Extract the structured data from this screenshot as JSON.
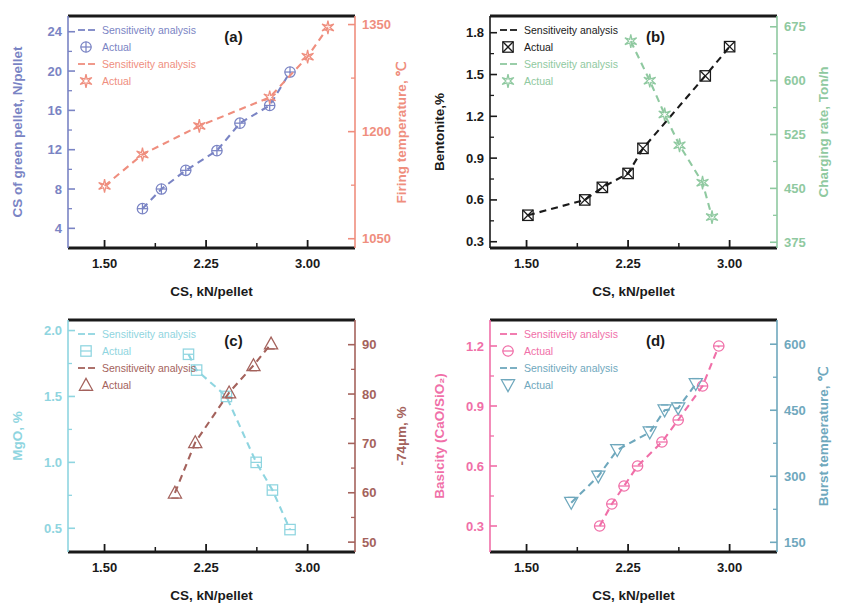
{
  "figure": {
    "width": 845,
    "height": 609,
    "background": "#ffffff"
  },
  "colors": {
    "axis_black": "#1a1a1a",
    "a_left": "#7a84c4",
    "a_right": "#ef8e7e",
    "b_left": "#1a1a1a",
    "b_right": "#8fc9a0",
    "c_left": "#8fd5e0",
    "c_right": "#a4625c",
    "d_left": "#f06fa8",
    "d_right": "#6fa8bd"
  },
  "common": {
    "xlabel": "CS, kN/pellet",
    "xticks": [
      "1.50",
      "2.25",
      "3.00"
    ],
    "xtick_values": [
      1.5,
      2.25,
      3.0
    ],
    "xlim": [
      1.23,
      3.35
    ],
    "legend_sensitivity": "Sensitiveity analysis",
    "legend_actual": "Actual"
  },
  "chart_data": [
    {
      "id": "a",
      "tag": "(a)",
      "type": "scatter",
      "title": "",
      "xlabel": "CS, kN/pellet",
      "xlim": [
        1.23,
        3.35
      ],
      "xticks": [
        1.5,
        2.25,
        3.0
      ],
      "xticklabels": [
        "1.50",
        "2.25",
        "3.00"
      ],
      "grid": false,
      "legend_position": "upper-left",
      "axes": [
        {
          "side": "left",
          "label": "CS of green pellet, N/pellet",
          "color": "#7a84c4",
          "ylim": [
            2.0,
            25.6
          ],
          "yticks": [
            4,
            8,
            12,
            16,
            20,
            24
          ],
          "yticklabels": [
            "4",
            "8",
            "12",
            "16",
            "20",
            "24"
          ]
        },
        {
          "side": "right",
          "label": "Firing temperature, ℃",
          "color": "#ef8e7e",
          "ylim": [
            1037,
            1362
          ],
          "yticks": [
            1050,
            1200,
            1350
          ],
          "yticklabels": [
            "1050",
            "1200",
            "1350"
          ]
        }
      ],
      "series": [
        {
          "name": "CS of green pellet, N/pellet",
          "legend_sensitivity": "Sensitiveity analysis",
          "legend_actual": "Actual",
          "axis": "left",
          "color": "#7a84c4",
          "marker": "circle-plus",
          "linestyle": "dashed",
          "x": [
            1.78,
            1.92,
            2.1,
            2.33,
            2.5,
            2.72,
            2.87
          ],
          "y": [
            6.0,
            8.0,
            9.9,
            11.9,
            14.7,
            16.5,
            19.9
          ]
        },
        {
          "name": "Firing temperature, ℃",
          "legend_sensitivity": "Sensitiveity analysis",
          "legend_actual": "Actual",
          "axis": "right",
          "color": "#ef8e7e",
          "marker": "star",
          "linestyle": "dashed",
          "x": [
            1.5,
            1.78,
            2.2,
            2.72,
            3.0,
            3.15
          ],
          "y": [
            1124,
            1168,
            1208,
            1248,
            1305,
            1346
          ]
        }
      ]
    },
    {
      "id": "b",
      "tag": "(b)",
      "type": "scatter",
      "title": "",
      "xlabel": "CS, kN/pellet",
      "xlim": [
        1.23,
        3.35
      ],
      "xticks": [
        1.5,
        2.25,
        3.0
      ],
      "xticklabels": [
        "1.50",
        "2.25",
        "3.00"
      ],
      "grid": false,
      "legend_position": "upper-left",
      "axes": [
        {
          "side": "left",
          "label": "Bentonite,%",
          "color": "#1a1a1a",
          "ylim": [
            0.255,
            1.92
          ],
          "yticks": [
            0.3,
            0.6,
            0.9,
            1.2,
            1.5,
            1.8
          ],
          "yticklabels": [
            "0.3",
            "0.6",
            "0.9",
            "1.2",
            "1.5",
            "1.8"
          ]
        },
        {
          "side": "right",
          "label": "Charging rate, Ton/h",
          "color": "#8fc9a0",
          "ylim": [
            367,
            690
          ],
          "yticks": [
            375,
            450,
            525,
            600,
            675
          ],
          "yticklabels": [
            "375",
            "450",
            "525",
            "600",
            "675"
          ]
        }
      ],
      "series": [
        {
          "name": "Bentonite,%",
          "legend_sensitivity": "Sensitiveity analysis",
          "legend_actual": "Actual",
          "axis": "left",
          "color": "#1a1a1a",
          "marker": "square-x",
          "linestyle": "dashed",
          "x": [
            1.51,
            1.93,
            2.06,
            2.25,
            2.36,
            2.82,
            3.0
          ],
          "y": [
            0.49,
            0.6,
            0.69,
            0.79,
            0.97,
            1.49,
            1.7
          ]
        },
        {
          "name": "Charging rate, Ton/h",
          "legend_sensitivity": "Sensitiveity analysis",
          "legend_actual": "Actual",
          "axis": "right",
          "color": "#8fc9a0",
          "marker": "star",
          "linestyle": "dashed",
          "x": [
            2.27,
            2.41,
            2.52,
            2.63,
            2.8,
            2.87
          ],
          "y": [
            655,
            600,
            553,
            510,
            458,
            410
          ]
        }
      ]
    },
    {
      "id": "c",
      "tag": "(c)",
      "type": "scatter",
      "title": "",
      "xlabel": "CS, kN/pellet",
      "xlim": [
        1.23,
        3.35
      ],
      "xticks": [
        1.5,
        2.25,
        3.0
      ],
      "xticklabels": [
        "1.50",
        "2.25",
        "3.00"
      ],
      "grid": false,
      "legend_position": "upper-left",
      "axes": [
        {
          "side": "left",
          "label": "MgO, %",
          "color": "#8fd5e0",
          "ylim": [
            0.32,
            2.08
          ],
          "yticks": [
            0.5,
            1.0,
            1.5,
            2.0
          ],
          "yticklabels": [
            "0.5",
            "1.0",
            "1.5",
            "2.0"
          ]
        },
        {
          "side": "right",
          "label": "-74µm, %",
          "color": "#a4625c",
          "ylim": [
            48,
            95
          ],
          "yticks": [
            50,
            60,
            70,
            80,
            90
          ],
          "yticklabels": [
            "50",
            "60",
            "70",
            "80",
            "90"
          ]
        }
      ],
      "series": [
        {
          "name": "MgO, %",
          "legend_sensitivity": "Sensitiveity analysis",
          "legend_actual": "Actual",
          "axis": "left",
          "color": "#8fd5e0",
          "marker": "square-h",
          "linestyle": "dashed",
          "x": [
            2.12,
            2.18,
            2.4,
            2.62,
            2.74,
            2.87
          ],
          "y": [
            1.82,
            1.7,
            1.5,
            1.0,
            0.79,
            0.49
          ]
        },
        {
          "name": "-74µm, %",
          "legend_sensitivity": "Sensitiveity analysis",
          "legend_actual": "Actual",
          "axis": "right",
          "color": "#a4625c",
          "marker": "triangle-up",
          "linestyle": "dashed",
          "x": [
            2.02,
            2.17,
            2.42,
            2.6,
            2.73
          ],
          "y": [
            60.0,
            70.2,
            80.3,
            85.8,
            90.2
          ]
        }
      ]
    },
    {
      "id": "d",
      "tag": "(d)",
      "type": "scatter",
      "title": "",
      "xlabel": "CS, kN/pellet",
      "xlim": [
        1.23,
        3.35
      ],
      "xticks": [
        1.5,
        2.25,
        3.0
      ],
      "xticklabels": [
        "1.50",
        "2.25",
        "3.00"
      ],
      "grid": false,
      "legend_position": "upper-left",
      "axes": [
        {
          "side": "left",
          "label": "Basicity (CaO/SiO₂)",
          "color": "#f06fa8",
          "ylim": [
            0.17,
            1.33
          ],
          "yticks": [
            0.3,
            0.6,
            0.9,
            1.2
          ],
          "yticklabels": [
            "0.3",
            "0.6",
            "0.9",
            "1.2"
          ]
        },
        {
          "side": "right",
          "label": "Burst temperature, ℃",
          "color": "#6fa8bd",
          "ylim": [
            128,
            655
          ],
          "yticks": [
            150,
            300,
            450,
            600
          ],
          "yticklabels": [
            "150",
            "300",
            "450",
            "600"
          ]
        }
      ],
      "series": [
        {
          "name": "Basicity (CaO/SiO2)",
          "legend_sensitivity": "Sensitiveity analysis",
          "legend_actual": "Actual",
          "axis": "left",
          "color": "#f06fa8",
          "marker": "circle-minus",
          "linestyle": "dashed",
          "x": [
            2.04,
            2.13,
            2.22,
            2.32,
            2.5,
            2.62,
            2.8,
            2.92
          ],
          "y": [
            0.3,
            0.41,
            0.5,
            0.6,
            0.72,
            0.83,
            1.0,
            1.2
          ]
        },
        {
          "name": "Burst temperature, ℃",
          "legend_sensitivity": "Sensitiveity analysis",
          "legend_actual": "Actual",
          "axis": "right",
          "color": "#6fa8bd",
          "marker": "triangle-down",
          "linestyle": "dashed",
          "x": [
            1.83,
            2.03,
            2.17,
            2.41,
            2.52,
            2.62,
            2.75
          ],
          "y": [
            240,
            300,
            360,
            400,
            450,
            455,
            510
          ]
        }
      ]
    }
  ]
}
